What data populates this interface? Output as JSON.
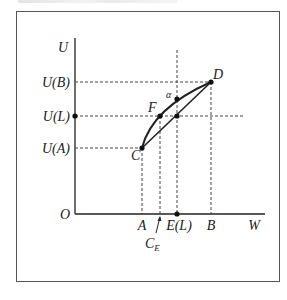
{
  "diagram": {
    "type": "expected-utility-risk-diagram",
    "axes": {
      "y_label": "U",
      "x_label": "W",
      "origin_label": "O"
    },
    "y_ticks": [
      {
        "label": "U(B)",
        "id": "ub"
      },
      {
        "label": "U(L)",
        "id": "ul"
      },
      {
        "label": "U(A)",
        "id": "ua"
      }
    ],
    "x_ticks": [
      {
        "label": "A",
        "id": "a"
      },
      {
        "label": "E(L)",
        "id": "el"
      },
      {
        "label": "B",
        "id": "b"
      }
    ],
    "annotation": {
      "label": "C",
      "subscript": "E"
    },
    "points": [
      {
        "label": "C"
      },
      {
        "label": "D"
      },
      {
        "label": "F"
      },
      {
        "label": "α"
      }
    ],
    "colors": {
      "line": "#222222",
      "dashed": "#444444",
      "frame": "#555555"
    }
  }
}
